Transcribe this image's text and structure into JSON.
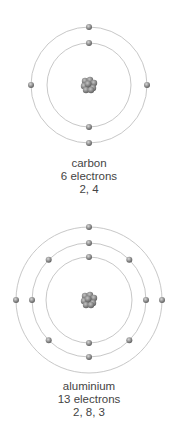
{
  "atoms": [
    {
      "name": "carbon",
      "electrons_label": "6 electrons",
      "configuration": "2, 4",
      "center": [
        89,
        85
      ],
      "shells": [
        {
          "radius": 42,
          "electrons": 2,
          "angles": [
            -90,
            90
          ]
        },
        {
          "radius": 58,
          "electrons": 4,
          "angles": [
            -90,
            0,
            90,
            180
          ]
        }
      ]
    },
    {
      "name": "aluminium",
      "electrons_label": "13 electrons",
      "configuration": "2, 8, 3",
      "center": [
        89,
        300
      ],
      "shells": [
        {
          "radius": 43,
          "electrons": 2,
          "angles": [
            -90,
            90
          ]
        },
        {
          "radius": 57,
          "electrons": 8,
          "angles": [
            -90,
            -45,
            0,
            45,
            90,
            135,
            180,
            225
          ]
        },
        {
          "radius": 73,
          "electrons": 3,
          "angles": [
            -90,
            0,
            180
          ]
        }
      ]
    }
  ],
  "colors": {
    "orbit": "#c8c8c8",
    "electron": "#8a8a8a",
    "nucleus": "#7a7a7a",
    "text": "#444444"
  }
}
